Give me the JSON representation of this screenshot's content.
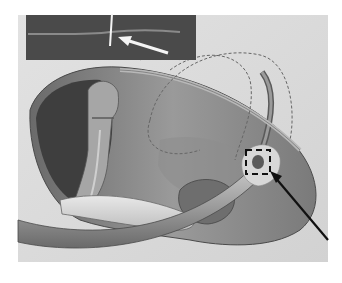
{
  "figure": {
    "colors": {
      "background": "#ffffff",
      "panel": "#d8d8d8",
      "inset": "#4a4a4a",
      "organ": "#8a8a8a",
      "organ_dark": "#5a5a5a",
      "cavity": "#3e3e3e",
      "tube": "#a8a8a8",
      "arrow_white": "#f4f4f4",
      "arrow_black": "#111111",
      "dashed_outline": "#666666"
    },
    "inset": {
      "label": "magnified-view",
      "arrow": "white-arrow"
    },
    "markers": {
      "dashed_box": "insertion-site-box",
      "pointer": "black-arrow"
    }
  }
}
